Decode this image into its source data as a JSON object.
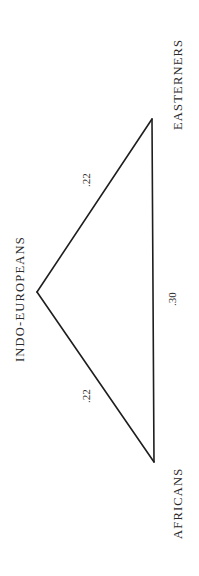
{
  "diagram": {
    "type": "genetic-distance-triangle",
    "nodes": [
      {
        "id": "easterners",
        "label": "EASTERNERS"
      },
      {
        "id": "indo_europeans",
        "label": "INDO-EUROPEANS"
      },
      {
        "id": "africans",
        "label": "AFRICANS"
      }
    ],
    "edges": [
      {
        "from": "indo_europeans",
        "to": "easterners",
        "label": ".22",
        "value": 0.22
      },
      {
        "from": "indo_europeans",
        "to": "africans",
        "label": ".22",
        "value": 0.22
      },
      {
        "from": "africans",
        "to": "easterners",
        "label": ".30",
        "value": 0.3
      }
    ],
    "colors": {
      "line": "#1e1e1e",
      "text": "#2a2a2a",
      "background": "#ffffff"
    }
  }
}
